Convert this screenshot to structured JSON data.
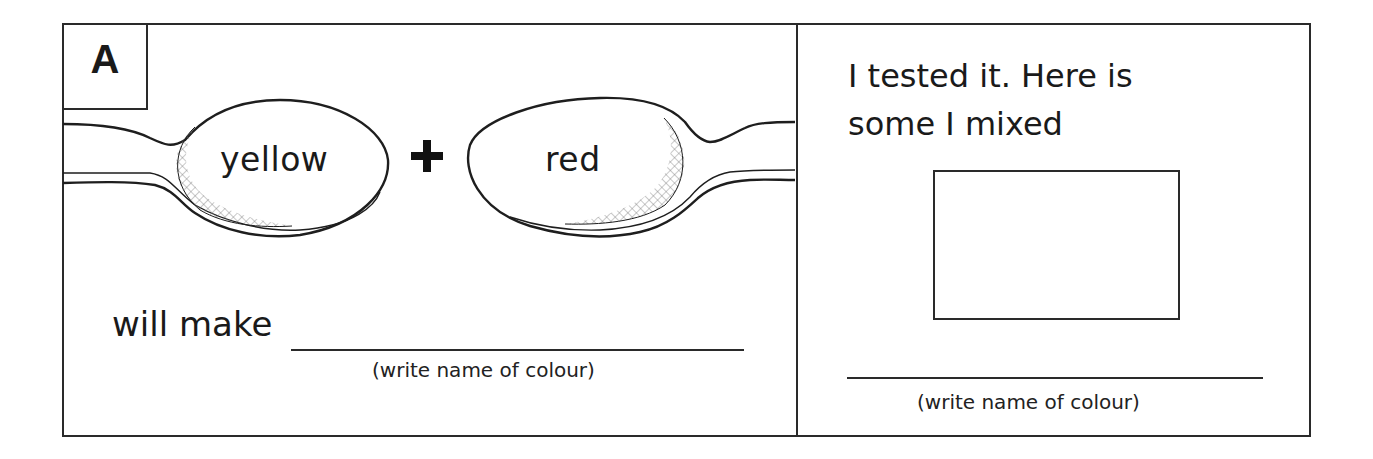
{
  "worksheet": {
    "panel_label": "A",
    "left_panel": {
      "spoon_left_text": "yellow",
      "operator": "+",
      "spoon_right_text": "red",
      "prompt": "will make",
      "hint": "(write name of colour)"
    },
    "right_panel": {
      "heading_line1": "I tested it. Here is",
      "heading_line2": "some I mixed",
      "hint": "(write name of colour)"
    }
  }
}
